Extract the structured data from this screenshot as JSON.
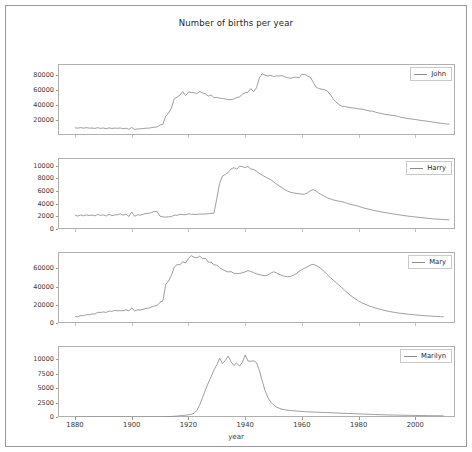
{
  "figure": {
    "title": "Number of births per year",
    "xlabel": "year",
    "background": "#ffffff",
    "line_color": "#8c8c8c",
    "frame_color": "#b0b0b0"
  },
  "chart_data": {
    "type": "line",
    "title": "Number of births per year",
    "xlabel": "year",
    "ylabel": "",
    "grid": false,
    "legend_position": "upper right",
    "xlim": [
      1874,
      2014
    ],
    "xticks": [
      1880,
      1900,
      1920,
      1940,
      1960,
      1980,
      2000
    ],
    "x_start": 1880,
    "x_end": 2010,
    "x_step": 1,
    "subplots": [
      {
        "name": "John",
        "legend": "John",
        "yticks": [
          20000,
          40000,
          60000,
          80000
        ],
        "ylim": [
          0,
          95000
        ],
        "values": [
          9655,
          9128,
          9932,
          9151,
          9832,
          9179,
          9317,
          8791,
          9734,
          8880,
          9388,
          8476,
          9531,
          8763,
          9124,
          9044,
          9329,
          8350,
          9109,
          7565,
          10078,
          7475,
          8111,
          8192,
          8634,
          9122,
          9161,
          9916,
          10498,
          10930,
          13427,
          14337,
          25293,
          29291,
          36027,
          48514,
          50811,
          53410,
          58096,
          52713,
          57472,
          57014,
          56549,
          55519,
          58178,
          56282,
          55003,
          52132,
          53490,
          50173,
          50224,
          49382,
          48890,
          48160,
          47413,
          47331,
          48227,
          50144,
          50974,
          54348,
          56694,
          57285,
          62090,
          57869,
          63238,
          76182,
          82119,
          79884,
          79042,
          79940,
          78211,
          79097,
          78978,
          79404,
          77888,
          76582,
          75932,
          77095,
          77318,
          76417,
          81142,
          81060,
          79100,
          77245,
          70620,
          64130,
          62105,
          61248,
          60640,
          58745,
          54230,
          48680,
          44310,
          40830,
          38652,
          38280,
          37462,
          36806,
          36118,
          35730,
          34950,
          34700,
          34010,
          32860,
          32120,
          31760,
          30580,
          29510,
          28750,
          27890,
          27260,
          26740,
          26110,
          25690,
          24810,
          23610,
          22980,
          22270,
          21740,
          21260,
          20640,
          20120,
          19510,
          18960,
          18540,
          18010,
          17490,
          16790,
          16250,
          15730,
          15240,
          14810,
          14460
        ],
        "peak_year": 1947,
        "peak_value": 82119
      },
      {
        "name": "Harry",
        "legend": "Harry",
        "yticks": [
          0,
          2000,
          4000,
          6000,
          8000,
          10000
        ],
        "ylim": [
          0,
          11200
        ],
        "values": [
          2153,
          2036,
          2216,
          2071,
          2231,
          2121,
          2215,
          2066,
          2291,
          2156,
          2223,
          2052,
          2320,
          2101,
          2214,
          2245,
          2399,
          2178,
          2342,
          1985,
          2695,
          2013,
          2240,
          2188,
          2315,
          2452,
          2465,
          2605,
          2780,
          2742,
          2021,
          1905,
          1876,
          1923,
          1951,
          2193,
          2160,
          2322,
          2265,
          2251,
          2380,
          2330,
          2305,
          2310,
          2360,
          2350,
          2380,
          2400,
          2460,
          2500,
          4800,
          7200,
          8350,
          8600,
          8900,
          9450,
          9680,
          9430,
          9900,
          9830,
          9700,
          9870,
          9450,
          9380,
          9100,
          8780,
          8500,
          8250,
          8000,
          7800,
          7450,
          7100,
          6800,
          6500,
          6200,
          5960,
          5800,
          5700,
          5620,
          5560,
          5500,
          5490,
          5700,
          6050,
          6200,
          6000,
          5650,
          5400,
          5150,
          4920,
          4750,
          4600,
          4480,
          4400,
          4320,
          4200,
          4050,
          3900,
          3800,
          3700,
          3580,
          3430,
          3300,
          3180,
          3080,
          2980,
          2880,
          2790,
          2700,
          2620,
          2550,
          2470,
          2400,
          2330,
          2260,
          2190,
          2120,
          2060,
          2000,
          1950,
          1900,
          1850,
          1800,
          1760,
          1710,
          1660,
          1620,
          1580,
          1550,
          1520,
          1490,
          1470,
          1450
        ],
        "peak_year": 1939,
        "peak_value": 9900
      },
      {
        "name": "Mary",
        "legend": "Mary",
        "yticks": [
          0,
          20000,
          40000,
          60000
        ],
        "ylim": [
          0,
          78000
        ],
        "values": [
          7065,
          6919,
          8148,
          8012,
          9217,
          9128,
          9889,
          9888,
          11754,
          11648,
          12078,
          11703,
          13172,
          12784,
          13862,
          13437,
          13495,
          13446,
          14477,
          13236,
          16706,
          13131,
          14486,
          14275,
          14962,
          16067,
          16370,
          17581,
          18666,
          19259,
          22848,
          24390,
          42476,
          46111,
          52458,
          61436,
          64268,
          63891,
          67368,
          65841,
          70980,
          73982,
          72175,
          71633,
          73424,
          70592,
          71151,
          66797,
          66847,
          63932,
          63488,
          60870,
          58766,
          57292,
          56126,
          56444,
          54752,
          54380,
          54480,
          55100,
          56200,
          57500,
          56700,
          55300,
          54000,
          53200,
          52500,
          51800,
          52600,
          54800,
          56200,
          55100,
          53400,
          52100,
          51300,
          50800,
          51200,
          52400,
          54200,
          56800,
          58700,
          60200,
          61800,
          63700,
          64500,
          63200,
          61500,
          59100,
          56200,
          53100,
          50000,
          47200,
          44500,
          41800,
          39000,
          36200,
          33400,
          30600,
          28400,
          26200,
          24200,
          22500,
          21000,
          19700,
          18500,
          17400,
          16400,
          15500,
          14700,
          13900,
          13200,
          12600,
          12000,
          11500,
          11000,
          10600,
          10200,
          9800,
          9500,
          9200,
          8900,
          8600,
          8350,
          8100,
          7900,
          7700,
          7500,
          7300,
          7150,
          7000,
          6850
        ],
        "peak_year": 1921,
        "peak_value": 73982
      },
      {
        "name": "Marilyn",
        "legend": "Marilyn",
        "yticks": [
          0,
          2500,
          5000,
          7500,
          10000
        ],
        "ylim": [
          0,
          12300
        ],
        "values": [
          0,
          0,
          0,
          0,
          0,
          0,
          0,
          0,
          0,
          0,
          0,
          0,
          0,
          0,
          0,
          0,
          0,
          0,
          0,
          0,
          0,
          0,
          0,
          0,
          0,
          0,
          6,
          8,
          10,
          14,
          22,
          35,
          52,
          74,
          96,
          124,
          168,
          215,
          268,
          310,
          385,
          470,
          640,
          1150,
          2150,
          3400,
          4700,
          5900,
          7000,
          8150,
          9050,
          10200,
          9250,
          9800,
          10550,
          9600,
          8900,
          9350,
          8800,
          9450,
          10750,
          9700,
          9650,
          9750,
          9400,
          8100,
          6300,
          4600,
          3400,
          2600,
          2100,
          1750,
          1500,
          1350,
          1250,
          1180,
          1120,
          1080,
          1040,
          1000,
          960,
          930,
          900,
          880,
          860,
          840,
          820,
          800,
          780,
          760,
          740,
          720,
          700,
          680,
          660,
          640,
          620,
          600,
          580,
          560,
          540,
          520,
          500,
          480,
          460,
          440,
          425,
          410,
          395,
          380,
          365,
          350,
          340,
          330,
          320,
          310,
          300,
          290,
          282,
          274,
          266,
          258,
          250,
          244,
          238,
          232,
          226,
          220,
          215,
          210,
          205
        ],
        "peak_year": 1942,
        "peak_value": 10750
      }
    ]
  }
}
